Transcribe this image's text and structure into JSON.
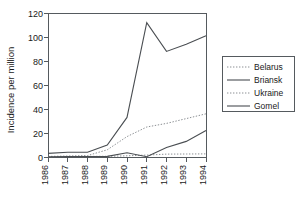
{
  "chart_data": {
    "type": "line",
    "title": "",
    "xlabel": "",
    "ylabel": "Incidence per million",
    "x": [
      "1986",
      "1987",
      "1988",
      "1989",
      "1990",
      "1991",
      "1992",
      "1993",
      "1994"
    ],
    "xlim": [
      1986,
      1994
    ],
    "ylim": [
      0,
      120
    ],
    "yticks": [
      0,
      20,
      40,
      60,
      80,
      100,
      120
    ],
    "xticks": [
      "1986",
      "1987",
      "1988",
      "1989",
      "1990",
      "1991",
      "1992",
      "1993",
      "1994"
    ],
    "grid": false,
    "legend_position": "right",
    "series": [
      {
        "name": "Belarus",
        "style": "dotted",
        "color": "#8b8f93",
        "values": [
          0.3,
          0.4,
          0.5,
          0.6,
          1.0,
          1.6,
          2.4,
          2.5,
          2.6
        ]
      },
      {
        "name": "Briansk",
        "style": "solid",
        "color": "#4a4e52",
        "values": [
          3,
          4,
          4,
          10,
          33,
          112,
          88,
          94,
          101
        ]
      },
      {
        "name": "Ukraine",
        "style": "dotted",
        "color": "#8b8f93",
        "values": [
          0.5,
          0.8,
          1.2,
          6,
          17,
          25,
          28,
          32,
          36
        ]
      },
      {
        "name": "Gomel",
        "style": "solid",
        "color": "#4a4e52",
        "values": [
          0.2,
          0.3,
          0.4,
          0.5,
          3.5,
          0.2,
          8,
          13,
          22
        ]
      }
    ]
  },
  "legend": {
    "entries": [
      {
        "label": "Belarus"
      },
      {
        "label": "Briansk"
      },
      {
        "label": "Ukraine"
      },
      {
        "label": "Gomel"
      }
    ]
  },
  "axes": {
    "y_axis_title": "Incidence per million",
    "y_tick_labels": [
      "0",
      "20",
      "40",
      "60",
      "80",
      "100",
      "120"
    ],
    "x_tick_labels": [
      "1986",
      "1987",
      "1988",
      "1989",
      "1990",
      "1991",
      "1992",
      "1993",
      "1994"
    ]
  }
}
